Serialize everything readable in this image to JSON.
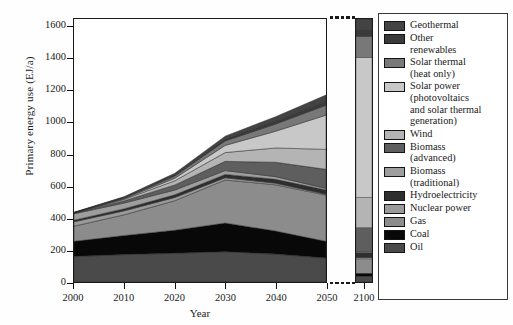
{
  "figure": {
    "ylabel": "Primary energy use (EJ/a)",
    "xlabel": "Year"
  },
  "chart_data": {
    "type": "area",
    "title": "",
    "xlabel": "Year",
    "ylabel": "Primary energy use (EJ/a)",
    "ylim": [
      0,
      1650
    ],
    "yticks": [
      0,
      200,
      400,
      600,
      800,
      1000,
      1200,
      1400,
      1600
    ],
    "xticks": [
      2000,
      2010,
      2020,
      2030,
      2040,
      2050,
      2100
    ],
    "axis_break": true,
    "axis_break_after": 2050,
    "grid": false,
    "legend_position": "right",
    "stacked": true,
    "stack_order_bottom_to_top": [
      "Oil",
      "Coal",
      "Gas",
      "Nuclear power",
      "Hydroelectricity",
      "Biomass (traditional)",
      "Biomass (advanced)",
      "Wind",
      "Solar power (photovoltaics and solar thermal generation)",
      "Solar thermal (heat only)",
      "Other renewables",
      "Geothermal"
    ],
    "x": [
      2000,
      2010,
      2020,
      2030,
      2040,
      2050
    ],
    "series": [
      {
        "name": "Oil",
        "color": "#4a4a4a",
        "values": [
          160,
          172,
          180,
          190,
          175,
          150
        ]
      },
      {
        "name": "Coal",
        "color": "#080808",
        "values": [
          95,
          120,
          145,
          180,
          145,
          105
        ]
      },
      {
        "name": "Gas",
        "color": "#8c8c8c",
        "values": [
          95,
          130,
          185,
          270,
          290,
          290
        ]
      },
      {
        "name": "Nuclear power",
        "color": "#9a9a9a",
        "values": [
          28,
          25,
          20,
          14,
          10,
          6
        ]
      },
      {
        "name": "Hydroelectricity",
        "color": "#2e2e2e",
        "values": [
          10,
          13,
          17,
          21,
          24,
          26
        ]
      },
      {
        "name": "Biomass (traditional)",
        "color": "#9e9e9e",
        "values": [
          40,
          36,
          30,
          24,
          17,
          10
        ]
      },
      {
        "name": "Biomass (advanced)",
        "color": "#5e5e5e",
        "values": [
          5,
          14,
          32,
          58,
          90,
          120
        ]
      },
      {
        "name": "Wind",
        "color": "#b4b4b4",
        "values": [
          1,
          9,
          26,
          55,
          90,
          125
        ]
      },
      {
        "name": "Solar power (photovoltaics and solar thermal generation)",
        "color": "#c8c8c8",
        "values": [
          0,
          4,
          16,
          45,
          105,
          215
        ]
      },
      {
        "name": "Solar thermal (heat only)",
        "color": "#787878",
        "values": [
          1,
          5,
          14,
          28,
          45,
          62
        ]
      },
      {
        "name": "Other renewables",
        "color": "#3a3a3a",
        "values": [
          1,
          3,
          7,
          12,
          18,
          24
        ]
      },
      {
        "name": "Geothermal",
        "color": "#434343",
        "values": [
          2,
          5,
          10,
          18,
          28,
          40
        ]
      }
    ],
    "far_column": {
      "x": 2100,
      "total": 1650,
      "values_bottom_to_top": [
        {
          "name": "Oil",
          "color": "#4a4a4a",
          "value": 35
        },
        {
          "name": "Coal",
          "color": "#080808",
          "value": 20
        },
        {
          "name": "Gas",
          "color": "#8c8c8c",
          "value": 90
        },
        {
          "name": "Nuclear power",
          "color": "#9a9a9a",
          "value": 8
        },
        {
          "name": "Hydroelectricity",
          "color": "#2e2e2e",
          "value": 32
        },
        {
          "name": "Biomass (traditional)",
          "color": "#9e9e9e",
          "value": 5
        },
        {
          "name": "Biomass (advanced)",
          "color": "#5e5e5e",
          "value": 150
        },
        {
          "name": "Wind",
          "color": "#b4b4b4",
          "value": 190
        },
        {
          "name": "Solar power (photovoltaics and solar thermal generation)",
          "color": "#c8c8c8",
          "value": 880
        },
        {
          "name": "Solar thermal (heat only)",
          "color": "#787878",
          "value": 130
        },
        {
          "name": "Other renewables",
          "color": "#3a3a3a",
          "value": 45
        },
        {
          "name": "Geothermal",
          "color": "#434343",
          "value": 65
        }
      ]
    }
  },
  "legend": {
    "items": [
      {
        "label_line1": "Geothermal",
        "label_line2": "",
        "color": "#434343"
      },
      {
        "label_line1": "Other",
        "label_line2": "renewables",
        "color": "#3a3a3a"
      },
      {
        "label_line1": "Solar thermal",
        "label_line2": "(heat only)",
        "color": "#787878"
      },
      {
        "label_line1": "Solar power",
        "label_line2": "(photovoltaics|and solar thermal|generation)",
        "color": "#c8c8c8"
      },
      {
        "label_line1": "Wind",
        "label_line2": "",
        "color": "#b4b4b4"
      },
      {
        "label_line1": "Biomass",
        "label_line2": "(advanced)",
        "color": "#5e5e5e"
      },
      {
        "label_line1": "Biomass",
        "label_line2": "(traditional)",
        "color": "#9e9e9e"
      },
      {
        "label_line1": "Hydroelectricity",
        "label_line2": "",
        "color": "#2e2e2e"
      },
      {
        "label_line1": "Nuclear power",
        "label_line2": "",
        "color": "#9a9a9a"
      },
      {
        "label_line1": "Gas",
        "label_line2": "",
        "color": "#8c8c8c"
      },
      {
        "label_line1": "Coal",
        "label_line2": "",
        "color": "#080808"
      },
      {
        "label_line1": "Oil",
        "label_line2": "",
        "color": "#4a4a4a"
      }
    ]
  }
}
